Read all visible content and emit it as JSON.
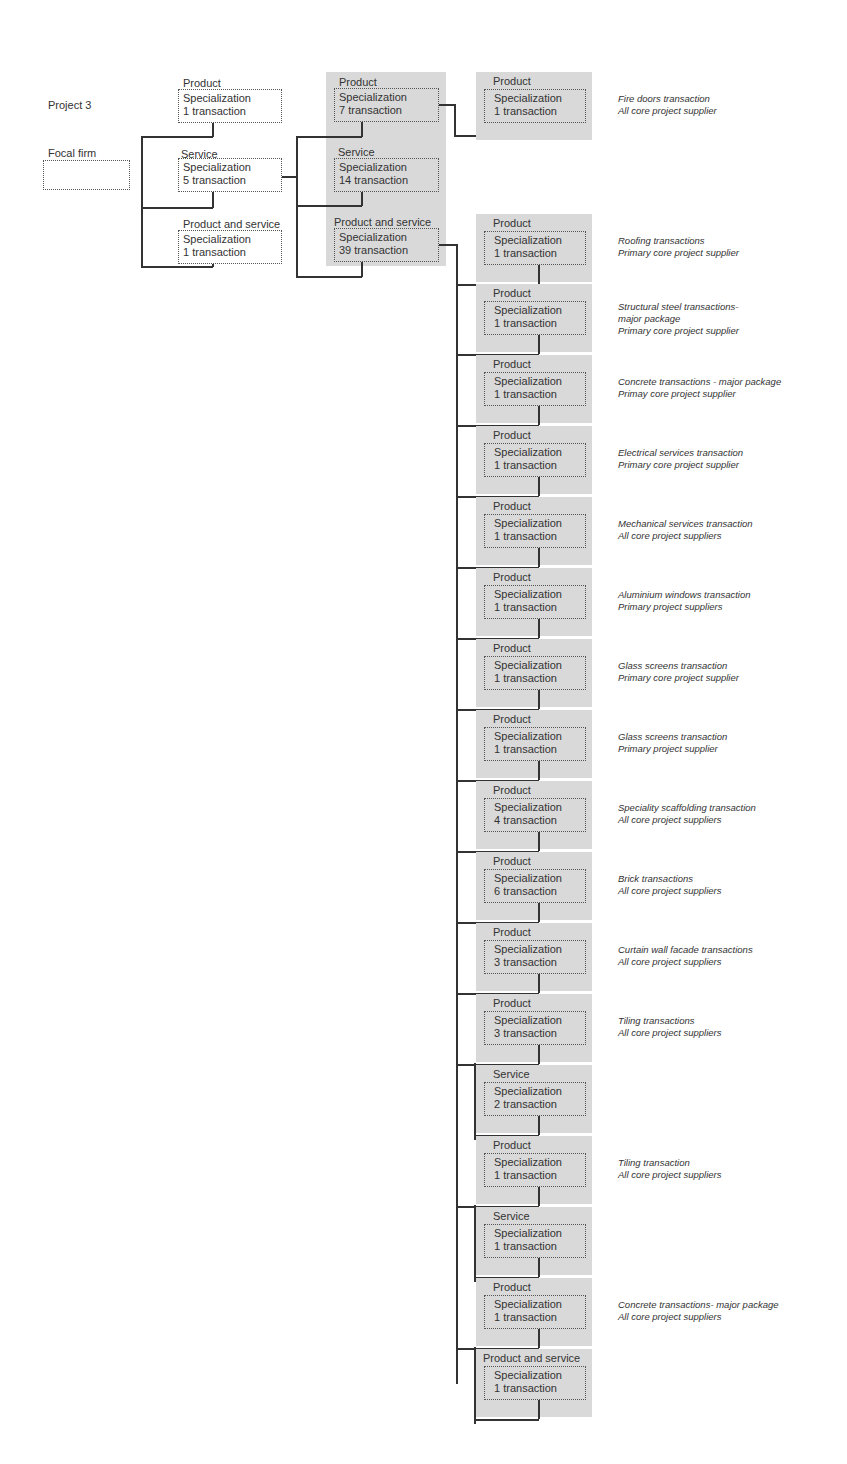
{
  "project": {
    "label": "Project 3"
  },
  "focal_firm": {
    "label": "Focal firm"
  },
  "level1": [
    {
      "type": "Product",
      "spec": "Specialization",
      "count": "1 transaction"
    },
    {
      "type": "Service",
      "spec": "Specialization",
      "count": "5 transaction"
    },
    {
      "type": "Product and service",
      "spec": "Specialization",
      "count": "1 transaction"
    }
  ],
  "level2": [
    {
      "type": "Product",
      "spec": "Specialization",
      "count": "7 transaction"
    },
    {
      "type": "Service",
      "spec": "Specialization",
      "count": "14 transaction"
    },
    {
      "type": "Product and service",
      "spec": "Specialization",
      "count": "39 transaction"
    }
  ],
  "level3": [
    {
      "type": "Product",
      "spec": "Specialization",
      "count": "1 transaction",
      "desc1": "Fire doors transaction",
      "desc2": "All core project supplier",
      "desc3": ""
    },
    {
      "type": "Product",
      "spec": "Specialization",
      "count": "1 transaction",
      "desc1": "Roofing transactions",
      "desc2": "Primary core project supplier",
      "desc3": ""
    },
    {
      "type": "Product",
      "spec": "Specialization",
      "count": "1 transaction",
      "desc1": "Structural steel transactions-",
      "desc2": "major package",
      "desc3": "Primary core project supplier"
    },
    {
      "type": "Product",
      "spec": "Specialization",
      "count": "1 transaction",
      "desc1": "Concrete transactions - major package",
      "desc2": "Primay core project supplier",
      "desc3": ""
    },
    {
      "type": "Product",
      "spec": "Specialization",
      "count": "1 transaction",
      "desc1": "Electrical services transaction",
      "desc2": "Primary core project supplier",
      "desc3": ""
    },
    {
      "type": "Product",
      "spec": "Specialization",
      "count": "1 transaction",
      "desc1": "Mechanical services transaction",
      "desc2": "All core project suppliers",
      "desc3": ""
    },
    {
      "type": "Product",
      "spec": "Specialization",
      "count": "1 transaction",
      "desc1": "Aluminium windows transaction",
      "desc2": "Primary project suppliers",
      "desc3": ""
    },
    {
      "type": "Product",
      "spec": "Specialization",
      "count": "1 transaction",
      "desc1": "Glass screens transaction",
      "desc2": "Primary core project supplier",
      "desc3": ""
    },
    {
      "type": "Product",
      "spec": "Specialization",
      "count": "1 transaction",
      "desc1": "Glass screens transaction",
      "desc2": "Primary project supplier",
      "desc3": ""
    },
    {
      "type": "Product",
      "spec": "Specialization",
      "count": "4 transaction",
      "desc1": "Speciality scaffolding transaction",
      "desc2": "All core project suppliers",
      "desc3": ""
    },
    {
      "type": "Product",
      "spec": "Specialization",
      "count": "6 transaction",
      "desc1": "Brick transactions",
      "desc2": "All core project suppliers",
      "desc3": ""
    },
    {
      "type": "Product",
      "spec": "Specialization",
      "count": "3 transaction",
      "desc1": "Curtain wall facade transactions",
      "desc2": "All core project suppliers",
      "desc3": ""
    },
    {
      "type": "Product",
      "spec": "Specialization",
      "count": "3 transaction",
      "desc1": "Tiling transactions",
      "desc2": "All core project suppliers",
      "desc3": ""
    },
    {
      "type": "Service",
      "spec": "Specialization",
      "count": "2 transaction",
      "desc1": "",
      "desc2": "",
      "desc3": ""
    },
    {
      "type": "Product",
      "spec": "Specialization",
      "count": "1 transaction",
      "desc1": "Tiling transaction",
      "desc2": "All core project suppliers",
      "desc3": ""
    },
    {
      "type": "Service",
      "spec": "Specialization",
      "count": "1 transaction",
      "desc1": "",
      "desc2": "",
      "desc3": ""
    },
    {
      "type": "Product",
      "spec": "Specialization",
      "count": "1 transaction",
      "desc1": "Concrete transactions- major package",
      "desc2": "All core project suppliers",
      "desc3": ""
    },
    {
      "type": "Product and service",
      "spec": "Specialization",
      "count": "1 transaction",
      "desc1": "",
      "desc2": "",
      "desc3": ""
    }
  ]
}
